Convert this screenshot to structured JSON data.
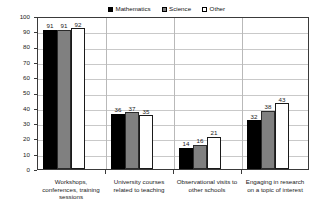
{
  "chart_data": {
    "type": "bar",
    "title": "",
    "subtitle": "",
    "xlabel": "",
    "ylabel": "Percent",
    "ylim": [
      0,
      100
    ],
    "ytick_step": 10,
    "yticks": [
      "100",
      "90",
      "80",
      "70",
      "60",
      "50",
      "40",
      "30",
      "20",
      "10",
      "0"
    ],
    "grid": true,
    "legend_position": "top-center",
    "categories": [
      "Workshops,\nconferences, training\nsessions",
      "University courses\nrelated to teaching",
      "Observational visits to\nother schools",
      "Engaging in research\non a topic of interest"
    ],
    "series": [
      {
        "name": "Mathematics",
        "color": "#000000",
        "values": [
          91,
          36,
          14,
          32
        ]
      },
      {
        "name": "Science",
        "color": "#808080",
        "values": [
          91,
          37,
          16,
          38
        ]
      },
      {
        "name": "Other",
        "color": "#ffffff",
        "values": [
          92,
          35,
          21,
          43
        ]
      }
    ]
  },
  "axis": {
    "y_title": "Percent"
  },
  "legend": {
    "entries": [
      {
        "label": "Mathematics",
        "swatch": "#000000"
      },
      {
        "label": "Science",
        "swatch": "#808080"
      },
      {
        "label": "Other",
        "swatch": "#ffffff"
      }
    ]
  }
}
